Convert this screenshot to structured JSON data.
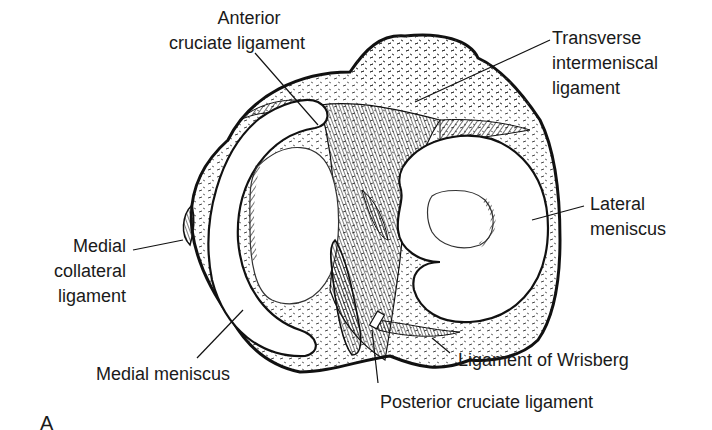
{
  "figure": {
    "panel_letter": "A",
    "labels": {
      "anterior_cruciate": [
        "Anterior",
        "cruciate ligament"
      ],
      "transverse_intermeniscal": [
        "Transverse",
        "intermeniscal",
        "ligament"
      ],
      "medial_collateral": [
        "Medial",
        "collateral",
        "ligament"
      ],
      "lateral_meniscus": [
        "Lateral",
        "meniscus"
      ],
      "medial_meniscus": [
        "Medial meniscus"
      ],
      "ligament_of_wrisberg": [
        "Ligament of Wrisberg"
      ],
      "posterior_cruciate": [
        "Posterior cruciate ligament"
      ]
    }
  }
}
